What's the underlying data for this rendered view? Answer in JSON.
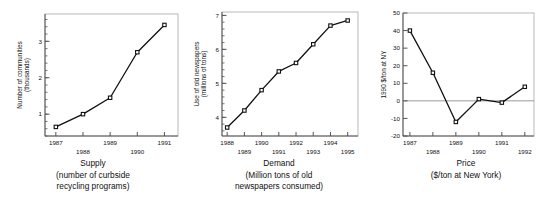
{
  "figure": {
    "panel_count": 3
  },
  "panels": [
    {
      "name": "supply",
      "caption_title": "Supply",
      "caption_line2": "(number of curbside",
      "caption_line3": "recycling programs)",
      "ylabel_line1": "Number of communities",
      "ylabel_line2": "(thousands)"
    },
    {
      "name": "demand",
      "caption_title": "Demand",
      "caption_line2": "(Million tons of old",
      "caption_line3": "newspapers consumed)",
      "ylabel_line1": "Use of old newspapers",
      "ylabel_line2": "(millions of tons)"
    },
    {
      "name": "price",
      "caption_title": "Price",
      "caption_line2": "($/ton at New York)",
      "caption_line3": "",
      "ylabel_line1": "1990 $/ton at NY",
      "ylabel_line2": ""
    }
  ],
  "chart_data": [
    {
      "type": "line",
      "title": "Supply",
      "subtitle": "(number of curbside recycling programs)",
      "xlabel": "",
      "ylabel": "Number of communities (thousands)",
      "x": [
        1987,
        1988,
        1989,
        1990,
        1991
      ],
      "xtick_labels": [
        "1987",
        "1988",
        "1989",
        "1990",
        "1991"
      ],
      "values": [
        0.65,
        1.0,
        1.45,
        2.7,
        3.45
      ],
      "ytick_labels": [
        "1",
        "2",
        "3"
      ],
      "yticks": [
        1,
        2,
        3
      ],
      "ylim": [
        0.4,
        3.75
      ],
      "xlim": [
        1986.6,
        1991.5
      ],
      "grid": false,
      "legend": "none",
      "marker": "open-square",
      "minor_ticks_y": true
    },
    {
      "type": "line",
      "title": "Demand",
      "subtitle": "(Million tons of old newspapers consumed)",
      "xlabel": "",
      "ylabel": "Use of old newspapers (millions of tons)",
      "x": [
        1988,
        1989,
        1990,
        1991,
        1992,
        1993,
        1994,
        1995
      ],
      "xtick_labels": [
        "1988",
        "1989",
        "1990",
        "1991",
        "1992",
        "1993",
        "1994",
        "1995"
      ],
      "values": [
        3.7,
        4.2,
        4.8,
        5.35,
        5.6,
        6.15,
        6.7,
        6.85
      ],
      "ytick_labels": [
        "4",
        "5",
        "6",
        "7"
      ],
      "yticks": [
        4,
        5,
        6,
        7
      ],
      "ylim": [
        3.45,
        7.1
      ],
      "xlim": [
        1987.7,
        1995.6
      ],
      "grid": false,
      "legend": "none",
      "marker": "open-square",
      "minor_ticks_y": true
    },
    {
      "type": "line",
      "title": "Price",
      "subtitle": "($/ton at New York)",
      "xlabel": "",
      "ylabel": "1990 $/ton at NY",
      "x": [
        1987,
        1988,
        1989,
        1990,
        1991,
        1992
      ],
      "xtick_labels": [
        "1987",
        "1988",
        "1989",
        "1990",
        "1991",
        "1992"
      ],
      "values": [
        40,
        16,
        -12,
        1,
        -1,
        8
      ],
      "ytick_labels": [
        "-20",
        "-10",
        "0",
        "10",
        "20",
        "30",
        "40",
        "50"
      ],
      "yticks": [
        -20,
        -10,
        0,
        10,
        20,
        30,
        40,
        50
      ],
      "ylim": [
        -20,
        50
      ],
      "xlim": [
        1986.7,
        1992.4
      ],
      "grid": false,
      "zero_line": 0,
      "legend": "none",
      "marker": "open-square",
      "minor_ticks_y": false
    }
  ],
  "colors": {
    "line": "#111111",
    "frame": "#b9b9b9",
    "axis": "#555555",
    "zero_line": "#999999",
    "marker_fill": "#ffffff",
    "text": "#111111",
    "background": "#ffffff"
  }
}
